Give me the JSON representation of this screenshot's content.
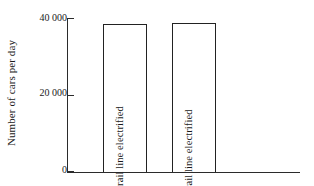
{
  "chart_data": {
    "type": "bar",
    "title": "",
    "subtitle": "",
    "xlabel": "",
    "ylabel": "Number of cars per day",
    "categories": [
      "Before rail line electrified",
      "After rail line electrified"
    ],
    "values": [
      38500,
      38600
    ],
    "ylim": [
      0,
      40000
    ],
    "yticks": [
      0,
      20000,
      40000
    ],
    "ytick_labels": [
      "0",
      "20 000",
      "40 000"
    ],
    "grid": false,
    "legend": false,
    "legend_position": "none",
    "bar_fill_color": "#ffffff",
    "bar_edge_color": "#222222",
    "axis_color": "#2b2b2b",
    "background_color": "#ffffff",
    "annotations": []
  },
  "axes": {
    "y_title": "Number of cars per day",
    "ticks": [
      {
        "label": "40 000",
        "value": 40000
      },
      {
        "label": "20 000",
        "value": 20000
      },
      {
        "label": "0",
        "value": 0
      }
    ]
  },
  "bars": [
    {
      "label": "Before rail line electrified",
      "value": 38500
    },
    {
      "label": "After rail line electrified",
      "value": 38600
    }
  ]
}
